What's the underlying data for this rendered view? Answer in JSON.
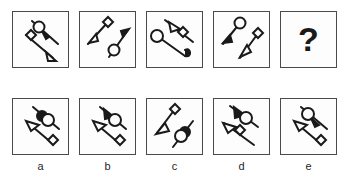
{
  "puzzle": {
    "type": "visual-analogy-matrix",
    "question_row": {
      "cells": [
        {
          "id": "q1",
          "label": "question-panel-1",
          "elements": [
            {
              "shape": "line",
              "orientation": "diagonal-down-right",
              "position": "upper-right",
              "markers": [
                "circle",
                "arrowhead-up-left"
              ]
            },
            {
              "shape": "line",
              "orientation": "diagonal-down-right",
              "position": "lower-left",
              "markers": [
                "diamond",
                "triangle-arrowhead-down-right"
              ]
            }
          ]
        },
        {
          "id": "q2",
          "label": "question-panel-2",
          "elements": [
            {
              "shape": "line",
              "orientation": "diagonal-down-left",
              "position": "upper-left",
              "markers": [
                "diamond",
                "arrowhead-down-left"
              ]
            },
            {
              "shape": "line",
              "orientation": "diagonal-down-left",
              "position": "lower-right",
              "markers": [
                "circle",
                "arrowhead-up-right"
              ]
            }
          ]
        },
        {
          "id": "q3",
          "label": "question-panel-3",
          "elements": [
            {
              "shape": "line",
              "orientation": "diagonal-down-right",
              "position": "upper-right",
              "markers": [
                "triangle-arrowhead-up-left",
                "diamond"
              ]
            },
            {
              "shape": "line",
              "orientation": "diagonal-down-right",
              "position": "lower-left",
              "markers": [
                "circle",
                "curled-hook-end"
              ]
            }
          ]
        },
        {
          "id": "q4",
          "label": "question-panel-4",
          "elements": [
            {
              "shape": "line",
              "orientation": "diagonal-down-left",
              "position": "upper-left",
              "markers": [
                "circle",
                "arrowhead-down-left"
              ]
            },
            {
              "shape": "line",
              "orientation": "diagonal-down-left",
              "position": "lower-right",
              "markers": [
                "diamond",
                "triangle-arrowhead-down-left"
              ]
            }
          ]
        },
        {
          "id": "q5",
          "label": "missing-answer-panel",
          "is_question_mark": true,
          "text": "?"
        }
      ]
    },
    "options_row": {
      "cells": [
        {
          "id": "a",
          "label": "a",
          "elements": [
            {
              "shape": "line",
              "orientation": "diagonal-down-right",
              "position": "upper-right",
              "markers": [
                "circle",
                "filled-circle-overlap"
              ]
            },
            {
              "shape": "line",
              "orientation": "diagonal-down-right",
              "position": "lower-left",
              "markers": [
                "triangle-arrowhead-up-left",
                "diamond"
              ]
            }
          ]
        },
        {
          "id": "b",
          "label": "b",
          "elements": [
            {
              "shape": "line",
              "orientation": "diagonal-down-right",
              "position": "upper-right",
              "markers": [
                "arrowhead-down-right",
                "circle"
              ]
            },
            {
              "shape": "line",
              "orientation": "diagonal-down-right",
              "position": "lower-left",
              "markers": [
                "triangle-arrowhead-up-left",
                "diamond"
              ]
            }
          ]
        },
        {
          "id": "c",
          "label": "c",
          "elements": [
            {
              "shape": "line",
              "orientation": "diagonal-down-left",
              "position": "upper-left",
              "markers": [
                "diamond",
                "triangle-arrowhead-down-left"
              ]
            },
            {
              "shape": "line",
              "orientation": "diagonal-down-left",
              "position": "lower-right",
              "markers": [
                "circle",
                "filled-circle-overlap"
              ]
            }
          ]
        },
        {
          "id": "d",
          "label": "d",
          "elements": [
            {
              "shape": "line",
              "orientation": "diagonal-down-right",
              "position": "upper-right",
              "markers": [
                "arrowhead-down-right",
                "circle"
              ]
            },
            {
              "shape": "line",
              "orientation": "diagonal-down-right",
              "position": "lower-left",
              "markers": [
                "triangle-arrowhead-up-left",
                "diamond"
              ]
            }
          ]
        },
        {
          "id": "e",
          "label": "e",
          "elements": [
            {
              "shape": "line",
              "orientation": "diagonal-down-right",
              "position": "upper-right",
              "markers": [
                "circle",
                "arrowhead-up-left"
              ]
            },
            {
              "shape": "line",
              "orientation": "diagonal-down-right",
              "position": "lower-left",
              "markers": [
                "triangle-arrowhead-up-left",
                "diamond"
              ]
            }
          ]
        }
      ]
    },
    "option_labels": [
      "a",
      "b",
      "c",
      "d",
      "e"
    ],
    "colors": {
      "stroke": "#1a1a1a",
      "border": "#4a4a4a",
      "background": "#fdfdfd",
      "page_background": "#ffffff",
      "label_text": "#262626"
    }
  }
}
